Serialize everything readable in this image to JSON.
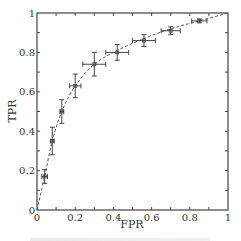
{
  "chart_data": {
    "type": "scatter",
    "title": "",
    "xlabel": "FPR",
    "ylabel": "TPR",
    "xlim": [
      0,
      1
    ],
    "ylim": [
      0,
      1
    ],
    "grid": false,
    "legend": null,
    "x_ticks": [
      "0",
      "0.2",
      "0.4",
      "0.6",
      "0.8",
      "1"
    ],
    "y_ticks": [
      "0",
      "0.2",
      "0.4",
      "0.6",
      "0.8",
      "1"
    ],
    "minor_tick_step": 0.1,
    "ticks_on_all_sides": true,
    "series": [
      {
        "name": "ROC points with error bars",
        "style": "cross markers with x/y error bars",
        "points": [
          {
            "x": 0.04,
            "y": 0.17,
            "xerr": 0.015,
            "yerr": 0.035
          },
          {
            "x": 0.08,
            "y": 0.35,
            "xerr": 0.01,
            "yerr": 0.07
          },
          {
            "x": 0.13,
            "y": 0.5,
            "xerr": 0.01,
            "yerr": 0.06
          },
          {
            "x": 0.2,
            "y": 0.63,
            "xerr": 0.03,
            "yerr": 0.06
          },
          {
            "x": 0.3,
            "y": 0.74,
            "xerr": 0.06,
            "yerr": 0.06
          },
          {
            "x": 0.42,
            "y": 0.8,
            "xerr": 0.06,
            "yerr": 0.04
          },
          {
            "x": 0.56,
            "y": 0.86,
            "xerr": 0.06,
            "yerr": 0.03
          },
          {
            "x": 0.7,
            "y": 0.91,
            "xerr": 0.05,
            "yerr": 0.02
          },
          {
            "x": 0.85,
            "y": 0.96,
            "xerr": 0.04,
            "yerr": 0.01
          }
        ]
      },
      {
        "name": "fitted ROC curve",
        "style": "dashed line",
        "x": [
          0,
          0.04,
          0.08,
          0.13,
          0.2,
          0.3,
          0.42,
          0.56,
          0.7,
          0.85,
          1.0
        ],
        "y": [
          0,
          0.17,
          0.35,
          0.5,
          0.63,
          0.74,
          0.81,
          0.87,
          0.92,
          0.96,
          1.0
        ]
      }
    ]
  },
  "axes": {
    "x_label": "FPR",
    "y_label": "TPR"
  },
  "colors": {
    "axis": "#444444",
    "marker": "#444444",
    "curve": "#555555",
    "background": "#ffffff"
  }
}
